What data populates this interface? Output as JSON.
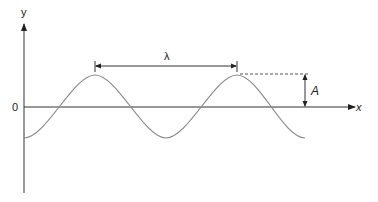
{
  "diagram": {
    "labels": {
      "y_axis": "y",
      "x_axis": "x",
      "origin": "0",
      "wavelength": "λ",
      "amplitude": "A"
    },
    "colors": {
      "axis": "#333333",
      "wave": "#888888",
      "annotation": "#333333"
    }
  }
}
